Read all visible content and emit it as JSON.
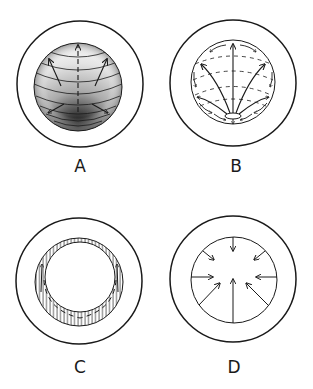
{
  "figure": {
    "panels": [
      {
        "id": "A",
        "label": "A",
        "description": "sphere with latitude arcs, shaded dense at bottom pole, arrows pointing upward and outward"
      },
      {
        "id": "B",
        "label": "B",
        "description": "sphere with meridians fanning from bottom pole, dashed latitude arcs, small arrows along rim pointing toward bottom"
      },
      {
        "id": "C",
        "label": "C",
        "description": "hatched crescent shell around white inner circle, dashed arc with upward arrows at sides"
      },
      {
        "id": "D",
        "label": "D",
        "description": "circle with eight arrows pointing inward toward center"
      }
    ],
    "colors": {
      "ink": "#1a1a1a",
      "background": "#ffffff"
    }
  }
}
